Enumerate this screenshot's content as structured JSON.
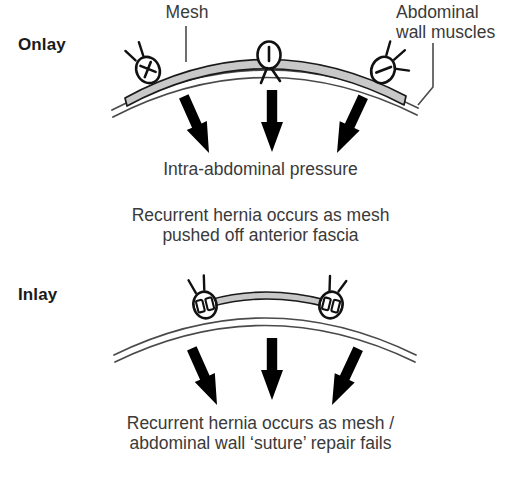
{
  "figure": {
    "title_absent": true,
    "background_color": "#ffffff",
    "ink_color": "#231f20",
    "mesh_fill_color": "#c8c8c8",
    "mesh_outline_color": "#1a1a1a",
    "wall_line_color": "#4a4a4a",
    "arrow_color": "#000000"
  },
  "panels": [
    {
      "id": "onlay",
      "label": "Onlay",
      "mesh_position": "on top of abdominal wall, spanning full arch",
      "suture_knot_count": 3,
      "arrow_count": 3,
      "pressure_label": "Intra-abdominal pressure",
      "caption_lines": [
        "Recurrent hernia occurs as mesh",
        "pushed off anterior fascia"
      ],
      "callouts": [
        {
          "name": "mesh",
          "lines": [
            "Mesh"
          ]
        },
        {
          "name": "abdominal-wall-muscles",
          "lines": [
            "Abdominal",
            "wall muscles"
          ]
        }
      ]
    },
    {
      "id": "inlay",
      "label": "Inlay",
      "mesh_position": "inlaid between two sutures within the wall gap",
      "suture_knot_count": 2,
      "arrow_count": 3,
      "pressure_label": "",
      "caption_lines": [
        "Recurrent hernia occurs as mesh /",
        "abdominal wall 'suture' repair fails"
      ],
      "callouts": []
    }
  ],
  "labels": {
    "onlay": "Onlay",
    "inlay": "Inlay",
    "mesh": "Mesh",
    "wall_line1": "Abdominal",
    "wall_line2": "wall muscles",
    "pressure": "Intra-abdominal pressure",
    "onlay_caption_line1": "Recurrent hernia occurs as mesh",
    "onlay_caption_line2": "pushed off anterior fascia",
    "inlay_caption_line1": "Recurrent hernia occurs as mesh /",
    "inlay_caption_line2": "abdominal wall ‘suture’ repair fails"
  }
}
